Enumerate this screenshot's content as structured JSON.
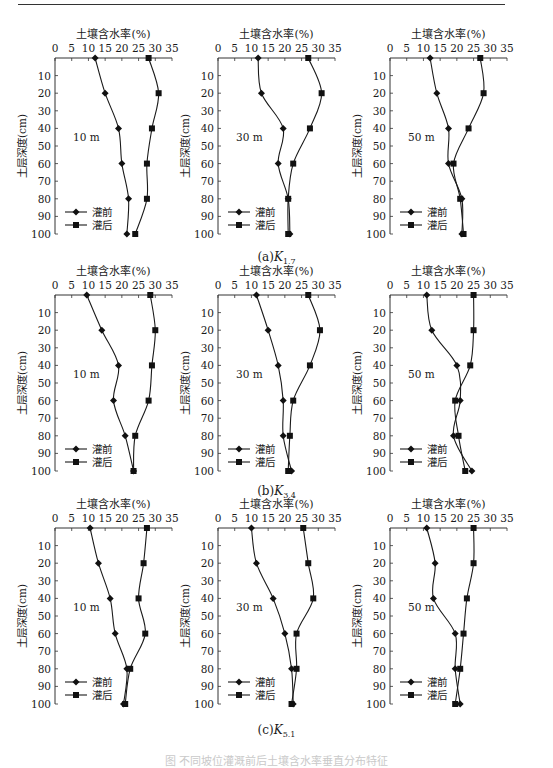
{
  "figure": {
    "panel_captions": [
      {
        "prefix": "(a)",
        "symbol": "K",
        "subscript": "1.7"
      },
      {
        "prefix": "(b)",
        "symbol": "K",
        "subscript": "3.4"
      },
      {
        "prefix": "(c)",
        "symbol": "K",
        "subscript": "5.1"
      }
    ],
    "figure_caption": "图  不同坡位灌溉前后土壤含水率垂直分布特征"
  },
  "chart_data": {
    "type": "line",
    "layout": "3x3 grid of vertical soil moisture profiles",
    "shared": {
      "xlabel": "土壤含水率(%)",
      "ylabel": "土层深度(cm)",
      "xlim": [
        0,
        35
      ],
      "ylim": [
        0,
        100
      ],
      "x_ticks": [
        0,
        5,
        10,
        15,
        20,
        25,
        30,
        35
      ],
      "y_ticks": [
        10,
        20,
        30,
        40,
        50,
        60,
        70,
        80,
        90,
        100
      ],
      "x_axis_position": "top",
      "y_axis_inverted": true,
      "depths": [
        0,
        20,
        40,
        60,
        80,
        100
      ],
      "legend": [
        {
          "name": "灌前",
          "marker": "diamond"
        },
        {
          "name": "灌后",
          "marker": "square"
        }
      ],
      "legend_position": "lower-left",
      "grid": false
    },
    "panels": [
      {
        "row": "(a)K1.7",
        "distance_label": "10 m",
        "series": [
          {
            "name": "灌前",
            "values": [
              12,
              15,
              19,
              20,
              22,
              21.5
            ]
          },
          {
            "name": "灌后",
            "values": [
              28,
              31,
              29,
              27.5,
              27.5,
              24
            ]
          }
        ]
      },
      {
        "row": "(a)K1.7",
        "distance_label": "30 m",
        "series": [
          {
            "name": "灌前",
            "values": [
              12,
              13,
              19.5,
              18,
              21,
              21.5
            ]
          },
          {
            "name": "灌后",
            "values": [
              27,
              31,
              27.5,
              22.5,
              21,
              21
            ]
          }
        ]
      },
      {
        "row": "(a)K1.7",
        "distance_label": "50 m",
        "series": [
          {
            "name": "灌前",
            "values": [
              12,
              14,
              17.5,
              17.5,
              21.5,
              21.5
            ]
          },
          {
            "name": "灌后",
            "values": [
              27,
              28,
              23.5,
              19,
              21,
              22
            ]
          }
        ]
      },
      {
        "row": "(b)K3.4",
        "distance_label": "10 m",
        "series": [
          {
            "name": "灌前",
            "values": [
              9.5,
              14,
              19,
              17.5,
              21,
              23.5
            ]
          },
          {
            "name": "灌后",
            "values": [
              28.5,
              30,
              29,
              28,
              24,
              23.5
            ]
          }
        ]
      },
      {
        "row": "(b)K3.4",
        "distance_label": "30 m",
        "series": [
          {
            "name": "灌前",
            "values": [
              11.5,
              15,
              18,
              19.5,
              19.5,
              22
            ]
          },
          {
            "name": "灌后",
            "values": [
              27,
              30.5,
              27.5,
              22.5,
              21.5,
              21
            ]
          }
        ]
      },
      {
        "row": "(b)K3.4",
        "distance_label": "50 m",
        "series": [
          {
            "name": "灌前",
            "values": [
              11,
              12.5,
              20,
              21,
              19,
              24.5
            ]
          },
          {
            "name": "灌后",
            "values": [
              25,
              25,
              24,
              19.5,
              20.5,
              22.5
            ]
          }
        ]
      },
      {
        "row": "(c)K5.1",
        "distance_label": "10 m",
        "series": [
          {
            "name": "灌前",
            "values": [
              10.5,
              13,
              16.5,
              18,
              21.5,
              20.5
            ]
          },
          {
            "name": "灌后",
            "values": [
              27.5,
              26.5,
              25,
              27,
              22.5,
              21
            ]
          }
        ]
      },
      {
        "row": "(c)K5.1",
        "distance_label": "30 m",
        "series": [
          {
            "name": "灌前",
            "values": [
              10,
              11.5,
              16.5,
              20,
              22,
              22.5
            ]
          },
          {
            "name": "灌后",
            "values": [
              25.5,
              27,
              28.5,
              23.5,
              23.5,
              22
            ]
          }
        ]
      },
      {
        "row": "(c)K5.1",
        "distance_label": "50 m",
        "series": [
          {
            "name": "灌前",
            "values": [
              11,
              13.5,
              13,
              19.5,
              19.5,
              21
            ]
          },
          {
            "name": "灌后",
            "values": [
              25,
              25,
              23,
              22,
              21,
              19.5
            ]
          }
        ]
      }
    ]
  }
}
